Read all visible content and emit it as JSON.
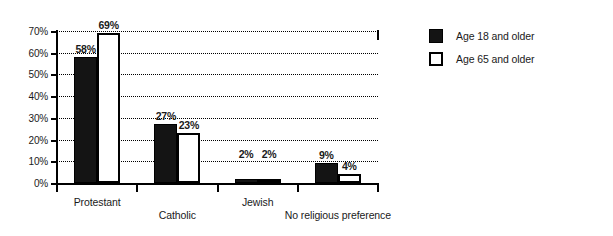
{
  "chart_data": {
    "type": "bar",
    "title": "",
    "xlabel": "",
    "ylabel": "",
    "categories": [
      "Protestant",
      "Catholic",
      "Jewish",
      "No religious preference"
    ],
    "series": [
      {
        "name": "Age 18 and older",
        "values": [
          58,
          27,
          2,
          9
        ],
        "color": "#141414",
        "style": "filled"
      },
      {
        "name": "Age 65 and older",
        "values": [
          69,
          23,
          2,
          4
        ],
        "color": "#ffffff",
        "style": "outlined"
      }
    ],
    "value_labels": [
      [
        "58%",
        "27%",
        "2%",
        "9%"
      ],
      [
        "69%",
        "23%",
        "2%",
        "4%"
      ]
    ],
    "ylim": [
      0,
      70
    ],
    "ytick_values": [
      0,
      10,
      20,
      30,
      40,
      50,
      60,
      70
    ],
    "ytick_labels": [
      "0%",
      "10%",
      "20%",
      "30%",
      "40%",
      "50%",
      "60%",
      "70%"
    ],
    "grid": "horizontal-dotted",
    "legend_position": "right",
    "legend": [
      "Age 18 and older",
      "Age 65 and older"
    ]
  }
}
